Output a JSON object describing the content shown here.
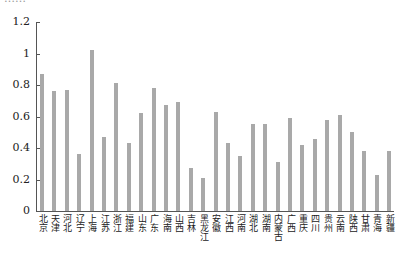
{
  "chart_data": {
    "type": "bar",
    "title": "",
    "xlabel": "",
    "ylabel": "",
    "ylim": [
      0,
      1.2
    ],
    "yticks": [
      "0",
      "0.2",
      "0.4",
      "0.6",
      "0.8",
      "1",
      "1.2"
    ],
    "grid": false,
    "legend": null,
    "categories": [
      "北京",
      "天津",
      "河北",
      "辽宁",
      "上海",
      "江苏",
      "浙江",
      "福建",
      "山东",
      "广东",
      "海南",
      "山西",
      "吉林",
      "黑龙江",
      "安徽",
      "江西",
      "河南",
      "湖北",
      "湖南",
      "内蒙古",
      "广西",
      "重庆",
      "四川",
      "贵州",
      "云南",
      "陕西",
      "甘肃",
      "青海",
      "新疆"
    ],
    "values": [
      0.87,
      0.76,
      0.77,
      0.36,
      1.02,
      0.47,
      0.81,
      0.43,
      0.62,
      0.78,
      0.67,
      0.69,
      0.27,
      0.21,
      0.63,
      0.43,
      0.35,
      0.55,
      0.55,
      0.31,
      0.59,
      0.42,
      0.46,
      0.58,
      0.61,
      0.5,
      0.38,
      0.23,
      0.38
    ],
    "bar_color": "#a9a9a9"
  },
  "cut_title": "……"
}
